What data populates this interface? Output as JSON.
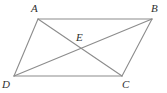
{
  "figure": {
    "type": "geometry-diagram",
    "shape": "parallelogram",
    "background_color": "#ffffff",
    "line_color": "#8c8c8c",
    "label_color": "#2f2f2f",
    "line_width": 1,
    "vertices": [
      {
        "name": "A",
        "label": "A",
        "x": 38,
        "y": 19,
        "label_x": 33,
        "label_y": 4
      },
      {
        "name": "B",
        "label": "B",
        "x": 152,
        "y": 19,
        "label_x": 152,
        "label_y": 4
      },
      {
        "name": "C",
        "label": "C",
        "x": 122,
        "y": 76,
        "label_x": 122,
        "label_y": 79
      },
      {
        "name": "D",
        "label": "D",
        "x": 14,
        "y": 76,
        "label_x": 2,
        "label_y": 79
      },
      {
        "name": "E",
        "label": "E",
        "x": 80,
        "y": 49,
        "label_x": 76,
        "label_y": 33
      }
    ],
    "edges": [
      {
        "name": "side-AB",
        "from": "A",
        "to": "B"
      },
      {
        "name": "side-BC",
        "from": "B",
        "to": "C"
      },
      {
        "name": "side-CD",
        "from": "C",
        "to": "D"
      },
      {
        "name": "side-DA",
        "from": "D",
        "to": "A"
      },
      {
        "name": "diagonal-AC",
        "from": "A",
        "to": "C"
      },
      {
        "name": "diagonal-BD",
        "from": "B",
        "to": "D"
      }
    ],
    "cropped_header": {
      "visible": true,
      "text": "",
      "color": "#c9c9cf"
    }
  }
}
